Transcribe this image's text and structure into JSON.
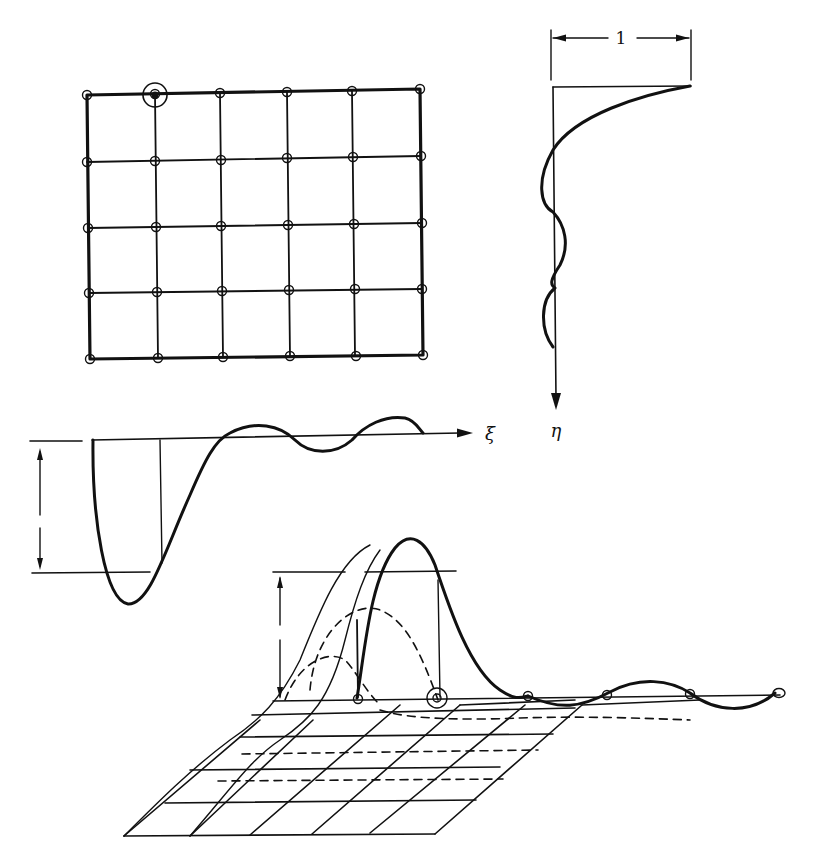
{
  "figure": {
    "plan_grid": {
      "cols": 6,
      "rows": 5,
      "highlighted_node": "top row, second column"
    },
    "eta_profile": {
      "dimension_label": "1",
      "axis_label": "η"
    },
    "xi_profile": {
      "axis_label": "ξ"
    },
    "surface_3d": {
      "description": "influence surface over plate grid with dashed section lines"
    }
  },
  "colors": {
    "ink": "#111111",
    "background": "#ffffff"
  }
}
